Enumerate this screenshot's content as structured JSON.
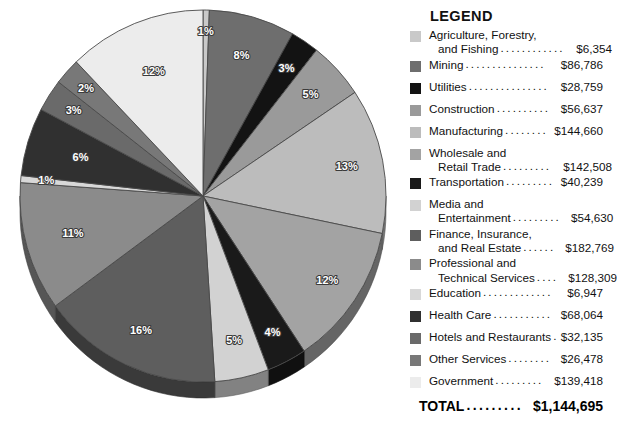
{
  "legend": {
    "title": "LEGEND",
    "total_label": "TOTAL",
    "total_value": "$1,144,695",
    "items": [
      {
        "name_line1": "Agriculture, Forestry,",
        "name_line2": "and Fishing",
        "value": "$6,354",
        "color": "#c9c9c9",
        "percent": "1%"
      },
      {
        "name_line1": "Mining",
        "name_line2": "",
        "value": "$86,786",
        "color": "#6e6e6e",
        "percent": "8%"
      },
      {
        "name_line1": "Utilities",
        "name_line2": "",
        "value": "$28,759",
        "color": "#131313",
        "percent": "3%"
      },
      {
        "name_line1": "Construction",
        "name_line2": "",
        "value": "$56,637",
        "color": "#9a9a9a",
        "percent": "5%"
      },
      {
        "name_line1": "Manufacturing",
        "name_line2": "",
        "value": "$144,660",
        "color": "#bcbcbc",
        "percent": "13%"
      },
      {
        "name_line1": "Wholesale and",
        "name_line2": "Retail Trade",
        "value": "$142,508",
        "color": "#a3a3a3",
        "percent": "12%"
      },
      {
        "name_line1": "Transportation",
        "name_line2": "",
        "value": "$40,239",
        "color": "#1a1a1a",
        "percent": "4%"
      },
      {
        "name_line1": "Media and",
        "name_line2": "Entertainment",
        "value": "$54,630",
        "color": "#d2d2d2",
        "percent": "5%"
      },
      {
        "name_line1": "Finance, Insurance,",
        "name_line2": "and Real Estate",
        "value": "$182,769",
        "color": "#5e5e5e",
        "percent": "16%"
      },
      {
        "name_line1": "Professional and",
        "name_line2": "Technical Services",
        "value": "$128,309",
        "color": "#8b8b8b",
        "percent": "11%"
      },
      {
        "name_line1": "Education",
        "name_line2": "",
        "value": "$6,947",
        "color": "#d8d8d8",
        "percent": "1%"
      },
      {
        "name_line1": "Health Care",
        "name_line2": "",
        "value": "$68,064",
        "color": "#303030",
        "percent": "6%"
      },
      {
        "name_line1": "Hotels and Restaurants",
        "name_line2": "",
        "value": "$32,135",
        "color": "#6a6a6a",
        "percent": "3%"
      },
      {
        "name_line1": "Other Services",
        "name_line2": "",
        "value": "$26,478",
        "color": "#787878",
        "percent": "2%"
      },
      {
        "name_line1": "Government",
        "name_line2": "",
        "value": "$139,418",
        "color": "#ececec",
        "percent": "12%"
      }
    ]
  },
  "chart_data": {
    "type": "pie",
    "title": "",
    "legend_position": "right",
    "units": "millions of dollars",
    "total": 1144695,
    "categories": [
      "Agriculture, Forestry, and Fishing",
      "Mining",
      "Utilities",
      "Construction",
      "Manufacturing",
      "Wholesale and Retail Trade",
      "Transportation",
      "Media and Entertainment",
      "Finance, Insurance, and Real Estate",
      "Professional and Technical Services",
      "Education",
      "Health Care",
      "Hotels and Restaurants",
      "Other Services",
      "Government"
    ],
    "values": [
      6354,
      86786,
      28759,
      56637,
      144660,
      142508,
      40239,
      54630,
      182769,
      128309,
      6947,
      68064,
      32135,
      26478,
      139418
    ],
    "percent_labels": [
      "1%",
      "8%",
      "3%",
      "5%",
      "13%",
      "12%",
      "4%",
      "5%",
      "16%",
      "11%",
      "1%",
      "6%",
      "3%",
      "2%",
      "12%"
    ],
    "colors": [
      "#c9c9c9",
      "#6e6e6e",
      "#131313",
      "#9a9a9a",
      "#bcbcbc",
      "#a3a3a3",
      "#1a1a1a",
      "#d2d2d2",
      "#5e5e5e",
      "#8b8b8b",
      "#d8d8d8",
      "#303030",
      "#6a6a6a",
      "#787878",
      "#ececec"
    ],
    "start_angle_deg": 0,
    "direction": "clockwise"
  }
}
